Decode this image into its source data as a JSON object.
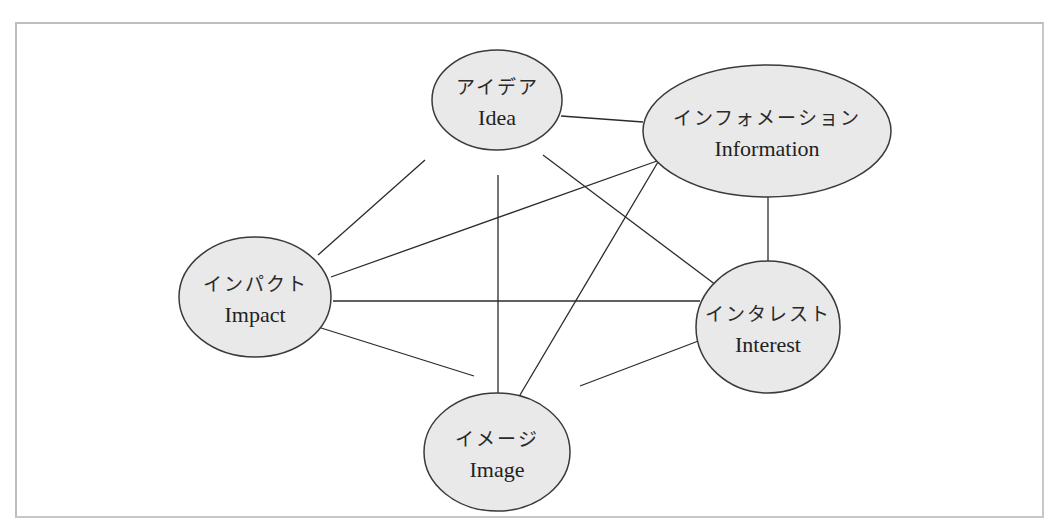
{
  "diagram": {
    "type": "network",
    "colors": {
      "node_fill": "#e9e9e9",
      "node_stroke": "#3a3a3a",
      "edge": "#2b2b2b",
      "frame": "#bdbdbd"
    },
    "nodes": [
      {
        "id": "idea",
        "label_jp": "アイデア",
        "label_en": "Idea"
      },
      {
        "id": "information",
        "label_jp": "インフォメーション",
        "label_en": "Information"
      },
      {
        "id": "impact",
        "label_jp": "インパクト",
        "label_en": "Impact"
      },
      {
        "id": "interest",
        "label_jp": "インタレスト",
        "label_en": "Interest"
      },
      {
        "id": "image",
        "label_jp": "イメージ",
        "label_en": "Image"
      }
    ],
    "edges": [
      [
        "idea",
        "information"
      ],
      [
        "idea",
        "impact"
      ],
      [
        "idea",
        "image"
      ],
      [
        "idea",
        "interest"
      ],
      [
        "information",
        "impact"
      ],
      [
        "information",
        "image"
      ],
      [
        "information",
        "interest"
      ],
      [
        "impact",
        "interest"
      ],
      [
        "impact",
        "image"
      ],
      [
        "interest",
        "image"
      ]
    ]
  }
}
